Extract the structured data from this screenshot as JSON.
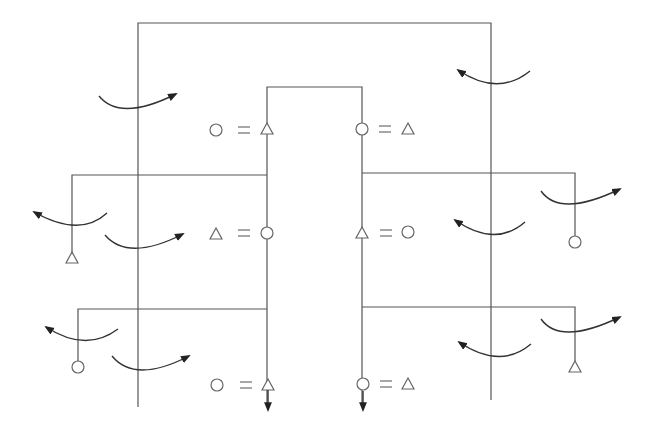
{
  "diagram": {
    "type": "gear-train-rotation-diagram",
    "colors": {
      "lines": "#555555",
      "symbols": "#666666",
      "arrows": "#333333",
      "background": "#ffffff"
    },
    "equations": [
      {
        "id": "top-left",
        "left": "circle",
        "op": "=",
        "right": "triangle"
      },
      {
        "id": "top-right",
        "left": "circle",
        "op": "=",
        "right": "triangle"
      },
      {
        "id": "mid-left",
        "left": "triangle",
        "op": "=",
        "right": "circle"
      },
      {
        "id": "mid-right",
        "left": "triangle",
        "op": "=",
        "right": "circle"
      },
      {
        "id": "bottom-left",
        "left": "circle",
        "op": "=",
        "right": "triangle"
      },
      {
        "id": "bottom-right",
        "left": "circle",
        "op": "=",
        "right": "triangle"
      }
    ],
    "branch_ends": [
      {
        "id": "left-upper",
        "symbol": "triangle"
      },
      {
        "id": "left-lower",
        "symbol": "circle"
      },
      {
        "id": "right-upper",
        "symbol": "circle"
      },
      {
        "id": "right-lower",
        "symbol": "triangle"
      }
    ],
    "rotation_arrows": [
      {
        "id": "outer-left-top",
        "direction": "right"
      },
      {
        "id": "outer-right-top",
        "direction": "left"
      },
      {
        "id": "left-branch-upper",
        "direction": "left"
      },
      {
        "id": "outer-left-mid",
        "direction": "right"
      },
      {
        "id": "outer-right-mid",
        "direction": "left"
      },
      {
        "id": "right-branch-upper",
        "direction": "right"
      },
      {
        "id": "left-branch-lower",
        "direction": "left"
      },
      {
        "id": "outer-left-bottom",
        "direction": "right"
      },
      {
        "id": "outer-right-bottom",
        "direction": "left"
      },
      {
        "id": "right-branch-lower",
        "direction": "right"
      }
    ],
    "output_arrows": [
      {
        "id": "inner-left-output",
        "direction": "down"
      },
      {
        "id": "inner-right-output",
        "direction": "down"
      }
    ]
  }
}
